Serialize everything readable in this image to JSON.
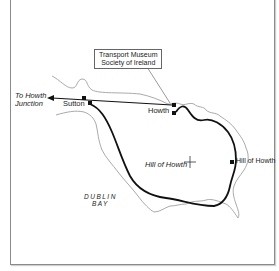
{
  "map": {
    "annotation_box": {
      "line1": "Transport Museum",
      "line2": "Society of Ireland"
    },
    "labels": {
      "to_howth_junction_line1": "To Howth",
      "to_howth_junction_line2": "Junction",
      "sutton": "Sutton",
      "howth": "Howth",
      "hill_of_howth_summit": "Hill of Howth",
      "hill_of_howth_station": "Hill of Howth",
      "dublin_bay_line1": "DUBLIN",
      "dublin_bay_line2": "BAY"
    },
    "colors": {
      "route": "#111111",
      "coastline": "#aaaaaa",
      "frame": "#8a8a8a",
      "background": "#ffffff"
    }
  }
}
